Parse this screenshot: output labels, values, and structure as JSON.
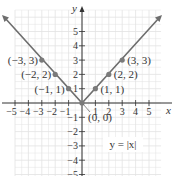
{
  "chart_data": {
    "type": "line",
    "title": "",
    "equation_label": "y = |x|",
    "xlabel": "x",
    "ylabel": "y",
    "xlim": [
      -5.5,
      6
    ],
    "ylim": [
      -5.5,
      6.5
    ],
    "x_ticks": [
      -5,
      -4,
      -3,
      -2,
      -1,
      1,
      2,
      3,
      4,
      5
    ],
    "y_ticks": [
      5,
      4,
      3,
      2,
      1,
      -1,
      -2,
      -3,
      -4,
      -5
    ],
    "grid": true,
    "series": [
      {
        "name": "y = |x|",
        "x": [
          -6,
          -3,
          -2,
          -1,
          0,
          1,
          2,
          3,
          6
        ],
        "y": [
          6,
          3,
          2,
          1,
          0,
          1,
          2,
          3,
          6
        ]
      }
    ],
    "points": [
      {
        "x": -3,
        "y": 3,
        "label": "(−3, 3)"
      },
      {
        "x": -2,
        "y": 2,
        "label": "(−2, 2)"
      },
      {
        "x": -1,
        "y": 1,
        "label": "(−1, 1)"
      },
      {
        "x": 0,
        "y": 0,
        "label": "(0, 0)"
      },
      {
        "x": 1,
        "y": 1,
        "label": "(1, 1)"
      },
      {
        "x": 2,
        "y": 2,
        "label": "(2, 2)"
      },
      {
        "x": 3,
        "y": 3,
        "label": "(3, 3)"
      }
    ],
    "colors": {
      "line": "#6e6e6e",
      "point": "#7a7a7a",
      "grid": "#e2e2e2",
      "axis": "#333333"
    }
  },
  "labels": {
    "x_axis": "x",
    "y_axis": "y",
    "equation": "y = |x|",
    "x_tick_labels": [
      "−5",
      "−4",
      "−3",
      "−2",
      "−1",
      "1",
      "2",
      "3",
      "4",
      "5"
    ],
    "y_tick_labels": [
      "5",
      "4",
      "3",
      "2",
      "1",
      "−1",
      "−2",
      "−3",
      "−4",
      "−5"
    ]
  }
}
